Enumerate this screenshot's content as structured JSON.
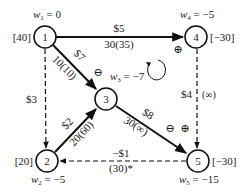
{
  "diagram": {
    "colors": {
      "line": "#111111",
      "background": "#ffffff"
    },
    "nodes": [
      {
        "id": "1",
        "label": "1",
        "supply": "[40]",
        "potential": "w1 = 0",
        "potential_var": "w",
        "potential_sub": "1",
        "potential_val": " = 0"
      },
      {
        "id": "2",
        "label": "2",
        "supply": "[20]",
        "potential": "w2 = -5",
        "potential_var": "w",
        "potential_sub": "2",
        "potential_val": " = −5"
      },
      {
        "id": "3",
        "label": "3",
        "supply": "",
        "potential": "w3 = -7",
        "potential_var": "w",
        "potential_sub": "3",
        "potential_val": " = −7"
      },
      {
        "id": "4",
        "label": "4",
        "supply": "[−30]",
        "potential": "w4 = -5",
        "potential_var": "w",
        "potential_sub": "4",
        "potential_val": " = −5"
      },
      {
        "id": "5",
        "label": "5",
        "supply": "[−30]",
        "potential": "w5 = -15",
        "potential_var": "w",
        "potential_sub": "5",
        "potential_val": " = −15"
      }
    ],
    "arcs": [
      {
        "from": "1",
        "to": "4",
        "cost": "$5",
        "flow_cap": "30(35)",
        "style": "solid",
        "basic": true
      },
      {
        "from": "1",
        "to": "3",
        "cost": "$7",
        "flow_cap": "10(10)",
        "style": "solid",
        "basic": true,
        "sign": "⊖"
      },
      {
        "from": "1",
        "to": "2",
        "cost": "$3",
        "flow_cap": "",
        "style": "dashed",
        "basic": false
      },
      {
        "from": "2",
        "to": "3",
        "cost": "$2",
        "flow_cap": "20(60)",
        "style": "solid",
        "basic": true
      },
      {
        "from": "3",
        "to": "5",
        "cost": "$8",
        "flow_cap": "30(∞)",
        "style": "solid",
        "basic": true,
        "sign": "⊖"
      },
      {
        "from": "4",
        "to": "5",
        "cost": "$4",
        "flow_cap": "(∞)",
        "style": "dashed",
        "basic": false,
        "sign": "⊕"
      },
      {
        "from": "5",
        "to": "2",
        "cost": "−$1",
        "flow_cap": "(30)*",
        "style": "dashed",
        "basic": false
      }
    ],
    "annotations": {
      "plus_near_4": "⊕",
      "minus_near_1_3": "⊖",
      "minus_near_3_5": "⊖",
      "plus_near_4_5": "⊕",
      "cycle_icon": "clockwise-cycle-arrow"
    }
  }
}
